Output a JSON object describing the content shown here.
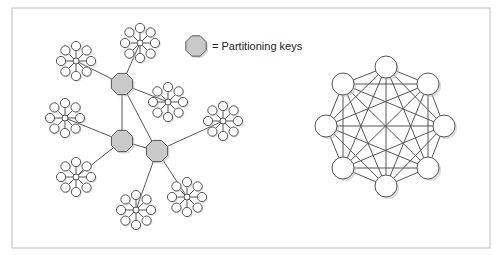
{
  "legend": {
    "label": "= Partitioning keys",
    "symbol": "octagon",
    "symbol_color": "#c9c9c9",
    "position": [
      196,
      46
    ]
  },
  "left_diagram": {
    "description": "Partitioned network: three partitioning keys connecting star clusters",
    "partitioning_keys": [
      {
        "id": "K1",
        "x": 122,
        "y": 84
      },
      {
        "id": "K2",
        "x": 122,
        "y": 141
      },
      {
        "id": "K3",
        "x": 157,
        "y": 151
      }
    ],
    "key_links": [
      [
        "K1",
        "K2"
      ],
      [
        "K2",
        "K3"
      ],
      [
        "K1",
        "K3"
      ]
    ],
    "clusters": [
      {
        "id": "A",
        "x": 76,
        "y": 61,
        "key": "K1"
      },
      {
        "id": "B",
        "x": 140,
        "y": 43,
        "key": "K1"
      },
      {
        "id": "C",
        "x": 168,
        "y": 102,
        "key": "K1"
      },
      {
        "id": "D",
        "x": 223,
        "y": 121,
        "key": "K3"
      },
      {
        "id": "E",
        "x": 65,
        "y": 118,
        "key": "K2"
      },
      {
        "id": "F",
        "x": 76,
        "y": 177,
        "key": "K2"
      },
      {
        "id": "G",
        "x": 136,
        "y": 210,
        "key": "K3"
      },
      {
        "id": "H",
        "x": 187,
        "y": 197,
        "key": "K3"
      }
    ],
    "satellites_per_cluster": 8
  },
  "right_diagram": {
    "description": "Fully connected mesh of 8 nodes",
    "center": [
      386,
      126
    ],
    "nodes": [
      {
        "x": 386,
        "y": 67
      },
      {
        "x": 428,
        "y": 84
      },
      {
        "x": 444,
        "y": 126
      },
      {
        "x": 428,
        "y": 168
      },
      {
        "x": 386,
        "y": 186
      },
      {
        "x": 343,
        "y": 168
      },
      {
        "x": 326,
        "y": 126
      },
      {
        "x": 343,
        "y": 84
      }
    ]
  },
  "colors": {
    "frame": "#c8c8c8",
    "line": "#555555",
    "key_fill": "#c9c9c9",
    "node_fill": "#ffffff"
  }
}
